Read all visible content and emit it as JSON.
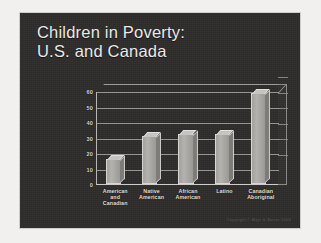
{
  "slide": {
    "title_line1": "Children in Poverty:",
    "title_line2": "U.S. and Canada",
    "background_color": "#2e2c2b",
    "title_color": "#e9e9e9",
    "footer": "Copyright © Allyn & Bacon 2004"
  },
  "chart_data": {
    "type": "bar",
    "title": "Children in Poverty: U.S. and Canada",
    "xlabel": "",
    "ylabel": "",
    "ylim": [
      0,
      60
    ],
    "yticks": [
      0,
      10,
      20,
      30,
      40,
      50,
      60
    ],
    "ytick_labels": [
      "0",
      "10",
      "20",
      "30",
      "40",
      "50",
      "60"
    ],
    "grid": true,
    "legend": "none",
    "three_d": true,
    "bar_color": "#a9a7a4",
    "categories": [
      "American and Canadian",
      "Native American",
      "African American",
      "Latino",
      "Canadian Aboriginal"
    ],
    "category_lines": [
      [
        "American",
        "and",
        "Canadian"
      ],
      [
        "Native",
        "American"
      ],
      [
        "African",
        "American"
      ],
      [
        "Latino"
      ],
      [
        "Canadian",
        "Aboriginal"
      ]
    ],
    "values": [
      16,
      31,
      32,
      32,
      59
    ]
  }
}
